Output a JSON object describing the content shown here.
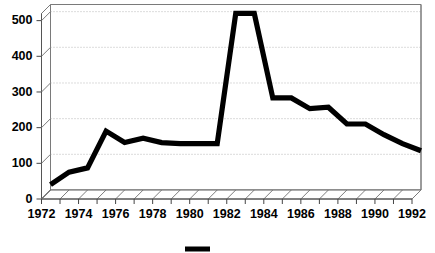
{
  "chart_data": {
    "type": "line",
    "title": "",
    "subtitle": "",
    "xlabel": "",
    "ylabel": "",
    "x": [
      1972,
      1973,
      1974,
      1975,
      1976,
      1977,
      1978,
      1979,
      1980,
      1981,
      1982,
      1983,
      1984,
      1985,
      1986,
      1987,
      1988,
      1989,
      1990,
      1991,
      1992
    ],
    "series": [
      {
        "name": "",
        "color": "#000000",
        "values": [
          15,
          50,
          62,
          165,
          133,
          145,
          133,
          130,
          130,
          130,
          495,
          495,
          258,
          258,
          228,
          232,
          185,
          185,
          155,
          130,
          110
        ]
      }
    ],
    "categories": [
      "1972",
      "1973",
      "1974",
      "1975",
      "1976",
      "1977",
      "1978",
      "1979",
      "1980",
      "1981",
      "1982",
      "1983",
      "1984",
      "1985",
      "1986",
      "1987",
      "1988",
      "1989",
      "1990",
      "1991",
      "1992"
    ],
    "xlim": [
      1972,
      1992
    ],
    "ylim": [
      0,
      520
    ],
    "y_ticks": [
      0,
      100,
      200,
      300,
      400,
      500
    ],
    "y_tick_labels": [
      "0",
      "100",
      "200",
      "300",
      "400",
      "500"
    ],
    "x_tick_labels": [
      "1972",
      "1974",
      "1976",
      "1978",
      "1980",
      "1982",
      "1984",
      "1986",
      "1988",
      "1990",
      "1992"
    ],
    "x_tick_values": [
      1972,
      1974,
      1976,
      1978,
      1980,
      1982,
      1984,
      1986,
      1988,
      1990,
      1992
    ],
    "grid": true,
    "grid_axis": "y",
    "legend": {
      "position": "bottom-center",
      "entries": [
        {
          "label": "",
          "color": "#000000",
          "marker": "line-swatch"
        }
      ]
    },
    "style": {
      "three_d": true,
      "floor_hatched": true,
      "plot_bg": "#ffffff",
      "grid_color": "#a8a8a8",
      "frame_color": "#7a7a7a",
      "line_color": "#000000",
      "text_color": "#000000"
    }
  }
}
